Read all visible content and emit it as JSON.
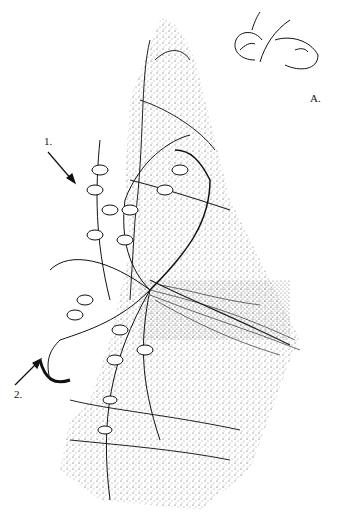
{
  "figure": {
    "labels": {
      "one": "1.",
      "two": "2.",
      "inset": "A."
    },
    "colors": {
      "ink": "#111111",
      "background": "#ffffff"
    }
  }
}
